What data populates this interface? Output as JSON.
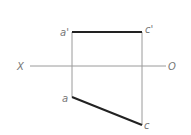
{
  "diagram": {
    "axis": {
      "left_label": "X",
      "right_label": "O"
    },
    "points": {
      "a_prime": "a'",
      "c_prime": "c'",
      "a": "a",
      "c": "c"
    },
    "colors": {
      "thick_line": "#222222",
      "thin_line": "#999999",
      "label": "#777777"
    }
  }
}
